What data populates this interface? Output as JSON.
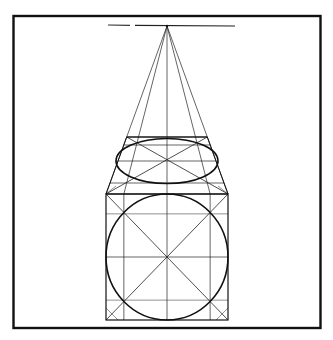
{
  "figure": {
    "title": "",
    "colors": {
      "background": "#ffffff",
      "ink": "#111111"
    },
    "elements": {
      "frame": "border-frame",
      "horizon": "horizon-line",
      "vanishing_point": "vanishing-point",
      "front_face": "front-square",
      "front_circle": "inscribed-circle",
      "top_face": "top-face-trapezoid",
      "top_ellipse": "top-ellipse",
      "construction_lines": "perspective-construction-lines"
    }
  }
}
